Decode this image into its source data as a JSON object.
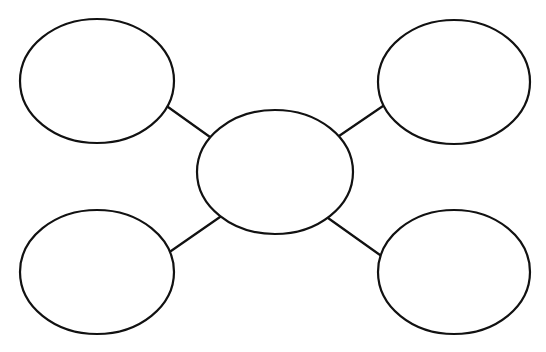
{
  "diagram": {
    "type": "bubble-map",
    "canvas": {
      "width": 546,
      "height": 352,
      "background": "#ffffff"
    },
    "stroke_color": "#111111",
    "stroke_width": 2.2,
    "fill_color": "#ffffff",
    "nodes": [
      {
        "id": "center",
        "label": "",
        "cx": 275,
        "cy": 172,
        "rx": 78,
        "ry": 62
      },
      {
        "id": "top-left",
        "label": "",
        "cx": 97,
        "cy": 81,
        "rx": 77,
        "ry": 62
      },
      {
        "id": "top-right",
        "label": "",
        "cx": 454,
        "cy": 82,
        "rx": 76,
        "ry": 62
      },
      {
        "id": "bottom-left",
        "label": "",
        "cx": 97,
        "cy": 272,
        "rx": 77,
        "ry": 62
      },
      {
        "id": "bottom-right",
        "label": "",
        "cx": 454,
        "cy": 272,
        "rx": 76,
        "ry": 62
      }
    ],
    "edges": [
      {
        "from": "top-left",
        "to": "center",
        "x1": 168,
        "y1": 107,
        "x2": 210,
        "y2": 137
      },
      {
        "from": "top-right",
        "to": "center",
        "x1": 383,
        "y1": 106,
        "x2": 339,
        "y2": 136
      },
      {
        "from": "bottom-left",
        "to": "center",
        "x1": 171,
        "y1": 251,
        "x2": 220,
        "y2": 217
      },
      {
        "from": "bottom-right",
        "to": "center",
        "x1": 380,
        "y1": 255,
        "x2": 328,
        "y2": 218
      }
    ]
  }
}
